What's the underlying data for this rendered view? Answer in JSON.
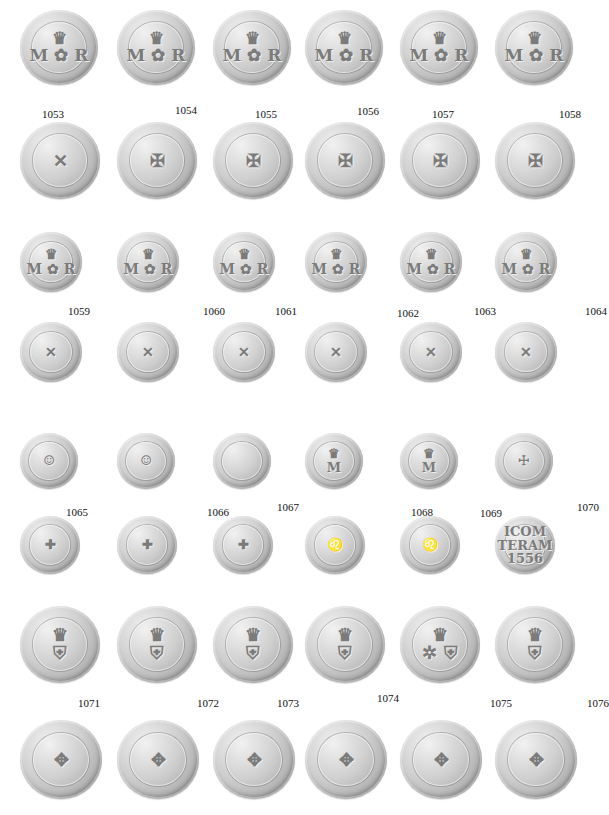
{
  "plate": {
    "background": "#ffffff",
    "coin_color": "#c4c4c4",
    "groups": [
      {
        "coins": [
          {
            "id": "1053",
            "obverse_motif": "crown-thistle-MR",
            "reverse_motif": "saltire-cross"
          },
          {
            "id": "1054",
            "obverse_motif": "crown-thistle-MR",
            "reverse_motif": "cross-potent-jerusalem"
          },
          {
            "id": "1055",
            "obverse_motif": "crown-thistle-MR",
            "reverse_motif": "cross-potent-jerusalem"
          },
          {
            "id": "1056",
            "obverse_motif": "crown-thistle-MR",
            "reverse_motif": "cross-potent-jerusalem"
          },
          {
            "id": "1057",
            "obverse_motif": "crown-thistle-MR",
            "reverse_motif": "cross-potent-jerusalem"
          },
          {
            "id": "1058",
            "obverse_motif": "crown-thistle-MR",
            "reverse_motif": "cross-potent-jerusalem"
          }
        ]
      },
      {
        "coins": [
          {
            "id": "1059",
            "obverse_motif": "crown-thistle-MR",
            "reverse_motif": "saltire"
          },
          {
            "id": "1060",
            "obverse_motif": "crown-thistle-MR",
            "reverse_motif": "saltire"
          },
          {
            "id": "1061",
            "obverse_motif": "crown-thistle-MR",
            "reverse_motif": "saltire"
          },
          {
            "id": "1062",
            "obverse_motif": "crown-thistle-MR",
            "reverse_motif": "saltire"
          },
          {
            "id": "1063",
            "obverse_motif": "crown-thistle-MR",
            "reverse_motif": "saltire"
          },
          {
            "id": "1064",
            "obverse_motif": "crown-thistle-MR",
            "reverse_motif": "saltire"
          }
        ]
      },
      {
        "coins": [
          {
            "id": "1065",
            "obverse_motif": "portrait-head",
            "reverse_motif": "long-cross"
          },
          {
            "id": "1066",
            "obverse_motif": "portrait-head",
            "reverse_motif": "long-cross"
          },
          {
            "id": "1067",
            "obverse_motif": "worn",
            "reverse_motif": "long-cross"
          },
          {
            "id": "1068",
            "obverse_motif": "crowned-M",
            "reverse_motif": "lion-rampant"
          },
          {
            "id": "1069",
            "obverse_motif": "crowned-M",
            "reverse_motif": "lion-rampant"
          },
          {
            "id": "1070",
            "obverse_motif": "cross-pillar",
            "reverse_motif": "legend-text",
            "reverse_text": "ICOM / TERAM / 1556"
          }
        ]
      },
      {
        "coins": [
          {
            "id": "1071",
            "obverse_motif": "crowned-shield",
            "reverse_motif": "cross-fleury"
          },
          {
            "id": "1072",
            "obverse_motif": "crowned-shield-damaged",
            "reverse_motif": "cross-fleury"
          },
          {
            "id": "1073",
            "obverse_motif": "crowned-shield",
            "reverse_motif": "cross-fleury"
          },
          {
            "id": "1074",
            "obverse_motif": "crowned-shield",
            "reverse_motif": "cross-fleury"
          },
          {
            "id": "1075",
            "obverse_motif": "crowned-shield-countermark",
            "reverse_motif": "cross-fleury"
          },
          {
            "id": "1076",
            "obverse_motif": "crowned-shield",
            "reverse_motif": "cross-fleury"
          }
        ]
      }
    ],
    "glyphs": {
      "crown-thistle-MR": "♛\nM ✿ R",
      "crowned-shield": "♛\n⛨",
      "crowned-shield-damaged": "♛\n⛨",
      "crowned-shield-countermark": "♛\n✲ ⛨",
      "saltire-cross": "✕",
      "saltire": "✕",
      "cross-potent-jerusalem": "✠",
      "portrait-head": "☺",
      "worn": "",
      "long-cross": "✚",
      "crowned-M": "♛\nM",
      "lion-rampant": "♌",
      "cross-pillar": "☩",
      "legend-text": "ICOM\nTERAM\n1556",
      "cross-fleury": "✥"
    }
  }
}
